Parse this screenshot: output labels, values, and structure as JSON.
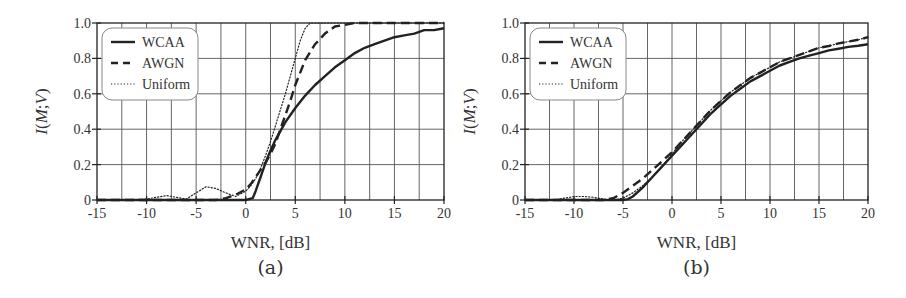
{
  "chart_data": [
    {
      "id": "a",
      "type": "line",
      "title": "",
      "caption": "(a)",
      "xlabel": "WNR, [dB]",
      "ylabel": "I(M;V)",
      "xlim": [
        -15,
        20
      ],
      "ylim": [
        0,
        1.0
      ],
      "xticks": [
        -15,
        -10,
        -5,
        0,
        5,
        10,
        15,
        20
      ],
      "xtick_labels": [
        "-15",
        "-10",
        "-5",
        "0",
        "5",
        "10",
        "15",
        "20"
      ],
      "yticks": [
        0,
        0.2,
        0.4,
        0.6,
        0.8,
        1.0
      ],
      "ytick_labels": [
        "0",
        "0.2",
        "0.4",
        "0.6",
        "0.8",
        "1.0"
      ],
      "grid": true,
      "grid_x_step": 2.5,
      "grid_y_step": 0.2,
      "legend_position": "upper left",
      "series": [
        {
          "name": "WCAA",
          "style": "solid",
          "x": [
            -15,
            -5,
            0,
            0.7,
            1,
            1.5,
            2,
            2.5,
            3,
            4,
            5,
            6,
            7,
            8,
            9,
            10,
            11,
            12,
            13,
            14,
            15,
            16,
            17,
            18,
            19,
            20
          ],
          "y": [
            0,
            0,
            0,
            0.01,
            0.05,
            0.13,
            0.21,
            0.28,
            0.34,
            0.44,
            0.52,
            0.59,
            0.65,
            0.7,
            0.75,
            0.79,
            0.83,
            0.86,
            0.88,
            0.9,
            0.92,
            0.93,
            0.94,
            0.96,
            0.96,
            0.97
          ]
        },
        {
          "name": "AWGN",
          "style": "dashed",
          "x": [
            -15,
            -3,
            -2,
            -1,
            0,
            0.5,
            1,
            1.5,
            2,
            2.5,
            3,
            3.5,
            4,
            4.5,
            5,
            5.5,
            6,
            7,
            8,
            9,
            10,
            11,
            12,
            15,
            20
          ],
          "y": [
            0,
            0,
            0.01,
            0.03,
            0.06,
            0.09,
            0.13,
            0.17,
            0.21,
            0.26,
            0.32,
            0.4,
            0.48,
            0.56,
            0.65,
            0.72,
            0.79,
            0.88,
            0.94,
            0.98,
            0.99,
            1.0,
            1.0,
            1.0,
            1.0
          ]
        },
        {
          "name": "Uniform",
          "style": "dotted",
          "x": [
            -15,
            -12,
            -10,
            -9,
            -8,
            -7,
            -6,
            -5,
            -4,
            -3,
            -2,
            -1,
            0,
            0.5,
            1,
            1.5,
            2,
            2.5,
            3,
            3.5,
            4,
            4.5,
            5,
            5.5,
            6,
            6.5,
            7,
            10,
            20
          ],
          "y": [
            0,
            0,
            0.005,
            0.015,
            0.025,
            0.015,
            0.005,
            0.04,
            0.075,
            0.065,
            0.04,
            0.02,
            0.05,
            0.08,
            0.12,
            0.18,
            0.25,
            0.33,
            0.42,
            0.51,
            0.6,
            0.7,
            0.8,
            0.9,
            0.97,
            1.0,
            1.0,
            1.0,
            1.0
          ]
        }
      ]
    },
    {
      "id": "b",
      "type": "line",
      "title": "",
      "caption": "(b)",
      "xlabel": "WNR, [dB]",
      "ylabel": "I(M;V)",
      "xlim": [
        -15,
        20
      ],
      "ylim": [
        0,
        1.0
      ],
      "xticks": [
        -15,
        -10,
        -5,
        0,
        5,
        10,
        15,
        20
      ],
      "xtick_labels": [
        "-15",
        "-10",
        "-5",
        "0",
        "5",
        "10",
        "15",
        "20"
      ],
      "yticks": [
        0,
        0.2,
        0.4,
        0.6,
        0.8,
        1.0
      ],
      "ytick_labels": [
        "0",
        "0.2",
        "0.4",
        "0.6",
        "0.8",
        "1.0"
      ],
      "grid": true,
      "grid_x_step": 2.5,
      "grid_y_step": 0.2,
      "legend_position": "upper left",
      "series": [
        {
          "name": "WCAA",
          "style": "solid",
          "x": [
            -15,
            -6,
            -5,
            -4.5,
            -4,
            -3,
            -2,
            -1,
            0,
            1,
            2,
            3,
            4,
            5,
            6,
            7,
            8,
            9,
            10,
            11,
            12,
            13,
            14,
            15,
            16,
            17,
            18,
            19,
            20
          ],
          "y": [
            0,
            0,
            0,
            0.005,
            0.02,
            0.07,
            0.13,
            0.19,
            0.25,
            0.31,
            0.37,
            0.43,
            0.49,
            0.54,
            0.59,
            0.63,
            0.67,
            0.7,
            0.73,
            0.76,
            0.78,
            0.8,
            0.815,
            0.83,
            0.845,
            0.855,
            0.865,
            0.872,
            0.88
          ]
        },
        {
          "name": "AWGN",
          "style": "dashed",
          "x": [
            -15,
            -7,
            -6,
            -5,
            -4,
            -3,
            -2,
            -1,
            0,
            1,
            2,
            3,
            4,
            5,
            6,
            7,
            8,
            9,
            10,
            11,
            12,
            13,
            14,
            15,
            16,
            17,
            18,
            19,
            20
          ],
          "y": [
            0,
            0,
            0.01,
            0.04,
            0.08,
            0.12,
            0.17,
            0.22,
            0.27,
            0.33,
            0.39,
            0.45,
            0.51,
            0.56,
            0.61,
            0.65,
            0.69,
            0.72,
            0.75,
            0.78,
            0.8,
            0.82,
            0.84,
            0.86,
            0.87,
            0.885,
            0.895,
            0.905,
            0.92
          ]
        },
        {
          "name": "Uniform",
          "style": "dotted",
          "x": [
            -15,
            -12,
            -11,
            -10,
            -9,
            -8,
            -7,
            -6,
            -5,
            -4,
            -3,
            -2,
            -1,
            0,
            1,
            2,
            3,
            4,
            5,
            6,
            7,
            8,
            9,
            10,
            11,
            12,
            13,
            14,
            15,
            16,
            17,
            18,
            19,
            20
          ],
          "y": [
            0,
            0,
            0.01,
            0.02,
            0.02,
            0.015,
            0.005,
            0,
            0.01,
            0.04,
            0.08,
            0.13,
            0.19,
            0.26,
            0.33,
            0.39,
            0.45,
            0.51,
            0.56,
            0.61,
            0.65,
            0.69,
            0.72,
            0.75,
            0.78,
            0.8,
            0.82,
            0.84,
            0.86,
            0.87,
            0.885,
            0.895,
            0.905,
            0.92
          ]
        }
      ]
    }
  ],
  "figure": {
    "line_color": "#222222",
    "grid_color": "#555555",
    "legend_border_color": "#888888"
  }
}
